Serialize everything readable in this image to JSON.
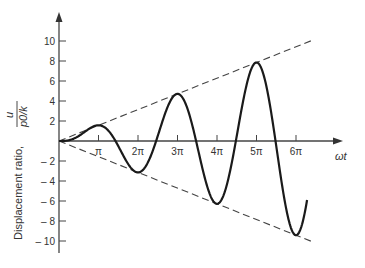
{
  "chart_data": {
    "type": "line",
    "title": "",
    "xlabel": "ωt",
    "ylabel": "Displacement ratio,",
    "ylabel_fraction": {
      "numerator": "u",
      "denominator": "p0/k"
    },
    "ylim": [
      -11,
      13
    ],
    "xlim_pi_units": [
      0,
      7.1
    ],
    "x_ticks": [
      {
        "value_pi": 1,
        "label": "π"
      },
      {
        "value_pi": 2,
        "label": "2π"
      },
      {
        "value_pi": 3,
        "label": "3π"
      },
      {
        "value_pi": 4,
        "label": "4π"
      },
      {
        "value_pi": 5,
        "label": "5π"
      },
      {
        "value_pi": 6,
        "label": "6π"
      }
    ],
    "y_ticks": [
      {
        "value": 10,
        "label": "10"
      },
      {
        "value": 8,
        "label": "8"
      },
      {
        "value": 6,
        "label": "6"
      },
      {
        "value": 4,
        "label": "4"
      },
      {
        "value": 2,
        "label": "2"
      },
      {
        "value": -2,
        "label": "– 2"
      },
      {
        "value": -4,
        "label": "– 4"
      },
      {
        "value": -6,
        "label": "– 6"
      },
      {
        "value": -8,
        "label": "– 8"
      },
      {
        "value": -10,
        "label": "– 10"
      }
    ],
    "grid": false,
    "legend": null,
    "series": [
      {
        "name": "response",
        "style": "solid",
        "formula": "0.5*(sin(ωt) - ωt*cos(ωt))",
        "x_pi_range": [
          0,
          6.28
        ],
        "x_pi": [
          0,
          0.5,
          1,
          1.5,
          2,
          2.5,
          3,
          3.5,
          4,
          4.5,
          5,
          5.5,
          6,
          6.28
        ],
        "values": [
          0,
          0.5,
          1.57,
          -0.5,
          -3.14,
          0.5,
          4.71,
          -0.5,
          -6.28,
          0.5,
          7.85,
          -0.5,
          -9.42,
          -5.8
        ]
      },
      {
        "name": "upper envelope",
        "style": "dashed",
        "formula": "+0.5*ωt",
        "x_pi": [
          0,
          6.45
        ],
        "values": [
          0,
          10.13
        ]
      },
      {
        "name": "lower envelope",
        "style": "dashed",
        "formula": "-0.5*ωt",
        "x_pi": [
          0,
          6.45
        ],
        "values": [
          0,
          -10.13
        ]
      }
    ],
    "colors": {
      "line": "#1a1a1a",
      "axis": "#444444",
      "dashed": "#444444"
    }
  }
}
